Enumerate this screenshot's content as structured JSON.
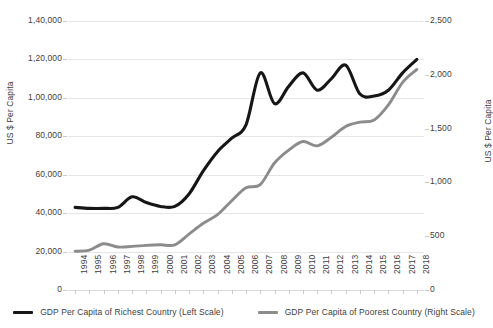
{
  "chart_data": {
    "type": "line",
    "title": "",
    "xlabel": "",
    "ylabel": "US $ Per Capita",
    "ylabel_right": "US $ Per Capita",
    "grid": true,
    "legend_position": "bottom",
    "x": [
      1994,
      1995,
      1996,
      1997,
      1998,
      1999,
      2000,
      2001,
      2002,
      2003,
      2004,
      2005,
      2006,
      2007,
      2008,
      2009,
      2010,
      2011,
      2012,
      2013,
      2014,
      2015,
      2016,
      2017,
      2018
    ],
    "categories": [
      "1994",
      "1995",
      "1996",
      "1997",
      "1998",
      "1999",
      "2000",
      "2001",
      "2002",
      "2003",
      "2004",
      "2005",
      "2006",
      "2007",
      "2008",
      "2009",
      "2010",
      "2011",
      "2012",
      "2013",
      "2014",
      "2015",
      "2016",
      "2017",
      "2018"
    ],
    "ylim": [
      0,
      140000
    ],
    "ylim_right": [
      0,
      2500
    ],
    "ytick_labels": [
      "1,40,000",
      "1,20,000",
      "1,00,000",
      "80,000",
      "60,000",
      "40,000",
      "20,000",
      "0"
    ],
    "ytick_values": [
      140000,
      120000,
      100000,
      80000,
      60000,
      40000,
      20000,
      0
    ],
    "ytick_labels_right": [
      "2,500",
      "2,000",
      "1,500",
      "1,000",
      "500",
      "0"
    ],
    "ytick_values_right": [
      2500,
      2000,
      1500,
      1000,
      500,
      0
    ],
    "series": [
      {
        "name": "GDP Per Capita of Richest Country (Left Scale)",
        "axis": "left",
        "color": "#161616",
        "values": [
          43000,
          42500,
          42500,
          43000,
          48500,
          45500,
          43500,
          43500,
          50000,
          62000,
          72000,
          79000,
          86000,
          113000,
          97000,
          106000,
          113000,
          104000,
          110000,
          117000,
          102000,
          101000,
          104000,
          113000,
          120000
        ]
      },
      {
        "name": "GDP Per Capita of Poorest Country (Right Scale)",
        "axis": "right",
        "color": "#8c8c8c",
        "values": [
          360,
          370,
          430,
          400,
          405,
          415,
          420,
          420,
          520,
          620,
          700,
          830,
          950,
          980,
          1180,
          1300,
          1380,
          1340,
          1420,
          1520,
          1560,
          1580,
          1720,
          1930,
          2050
        ]
      }
    ]
  },
  "legend": {
    "items": [
      {
        "label": "GDP Per Capita of Richest Country (Left Scale)",
        "color": "#161616"
      },
      {
        "label": "GDP Per Capita of Poorest Country (Right Scale)",
        "color": "#8c8c8c"
      }
    ]
  },
  "axes": {
    "left_title": "US $ Per Capita",
    "right_title": "US $ Per Capita"
  }
}
